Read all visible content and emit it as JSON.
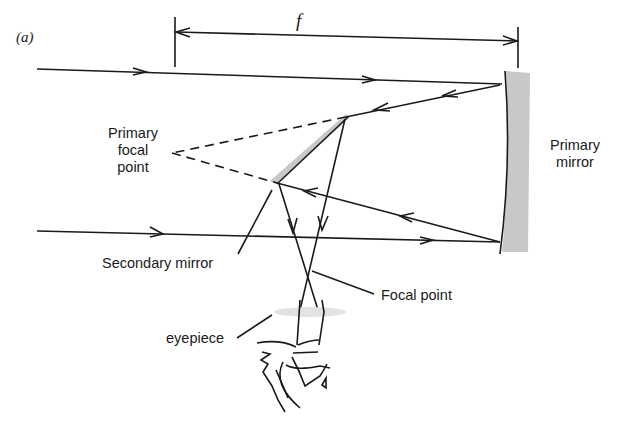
{
  "figure": {
    "panel_label": "(a)",
    "focal_length_label": "f",
    "labels": {
      "primary_focal_point": [
        "Primary",
        "focal",
        "point"
      ],
      "primary_mirror": [
        "Primary",
        "mirror"
      ],
      "secondary_mirror": "Secondary mirror",
      "focal_point": "Focal point",
      "eyepiece": "eyepiece"
    },
    "colors": {
      "ink": "#1a1a1a",
      "mirror_shading": "#c8c8c8",
      "background": "#ffffff"
    }
  }
}
